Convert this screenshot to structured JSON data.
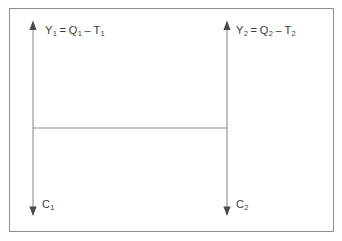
{
  "figure": {
    "type": "diagram",
    "background_color": "#ffffff",
    "frame": {
      "border_color": "#8e8e8e",
      "x": 9,
      "y": 8,
      "width": 325,
      "height": 224
    },
    "line_color": "#8e8e8e",
    "text_color": "#3c3c3c"
  },
  "arrows": [
    {
      "name": "left-arrow",
      "x": 33,
      "top_y": 22,
      "bottom_y": 215,
      "double_headed": true,
      "top_label_key": "y1",
      "bottom_label_key": "c1"
    },
    {
      "name": "right-arrow",
      "x": 227,
      "top_y": 22,
      "bottom_y": 215,
      "double_headed": true,
      "top_label_key": "y2",
      "bottom_label_key": "c2"
    }
  ],
  "connector": {
    "name": "horizontal-connector",
    "x1": 33,
    "x2": 227,
    "y": 128
  },
  "labels": {
    "y1": {
      "var": "Y",
      "var_sub": "1",
      "equals": "=",
      "term1": "Q",
      "term1_sub": "1",
      "operator": "–",
      "term2": "T",
      "term2_sub": "1",
      "full_text": "Y₁ = Q₁ – T₁"
    },
    "y2": {
      "var": "Y",
      "var_sub": "2",
      "equals": "=",
      "term1": "Q",
      "term1_sub": "2",
      "operator": "–",
      "term2": "T",
      "term2_sub": "2",
      "full_text": "Y₂ = Q₂ – T₂"
    },
    "c1": {
      "var": "C",
      "var_sub": "1",
      "full_text": "C₁"
    },
    "c2": {
      "var": "C",
      "var_sub": "2",
      "full_text": "C₂"
    }
  }
}
